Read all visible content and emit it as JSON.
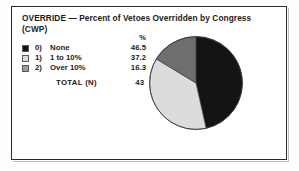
{
  "figure": {
    "title": "OVERRIDE — Percent of Vetoes Overridden by Congress (CWP)",
    "percent_header": "%",
    "total_label": "TOTAL  (N)",
    "total_value": "43"
  },
  "legend": {
    "rows": [
      {
        "key": "0)",
        "label": "None",
        "value": "46.5",
        "swatch": "black-swatch-icon",
        "color": "#141414"
      },
      {
        "key": "1)",
        "label": "1 to 10%",
        "value": "37.2",
        "swatch": "light-gray-swatch-icon",
        "color": "#dcdcdc"
      },
      {
        "key": "2)",
        "label": "Over 10%",
        "value": "16.3",
        "swatch": "mid-gray-swatch-icon",
        "color": "#9a9a9a"
      }
    ]
  },
  "chart_data": {
    "type": "pie",
    "title": "OVERRIDE — Percent of Vetoes Overridden by Congress (CWP)",
    "categories": [
      "0) None",
      "1) 1 to 10%",
      "2) Over 10%"
    ],
    "values": [
      46.5,
      37.2,
      16.3
    ],
    "value_unit": "%",
    "colors": [
      "#141414",
      "#dcdcdc",
      "#6e6e6e"
    ],
    "total_n": 43,
    "start_angle_deg": 0,
    "direction": "clockwise",
    "legend": "left",
    "grid": false
  }
}
